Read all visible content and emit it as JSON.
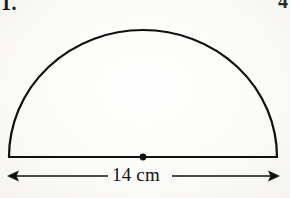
{
  "page": {
    "background_color": "#fcfcfa",
    "ink_color": "#111111"
  },
  "labels": {
    "question_number_left": "1.",
    "question_number_right": "4"
  },
  "figure": {
    "name": "semicircle-with-diameter",
    "shape_label": "semicircle",
    "center_dot": true,
    "diameter_line": true,
    "stroke_color": "#111111",
    "stroke_width": 2
  },
  "dimension": {
    "value": "14",
    "unit": "cm",
    "text": "14 cm",
    "arrow_left": "left-arrowhead",
    "arrow_right": "right-arrowhead"
  },
  "geometry": {
    "left_foot_x": 9,
    "right_foot_x": 277,
    "baseline_y": 157,
    "apex_y": 30,
    "center_x": 143,
    "dimension_line_y": 176
  }
}
